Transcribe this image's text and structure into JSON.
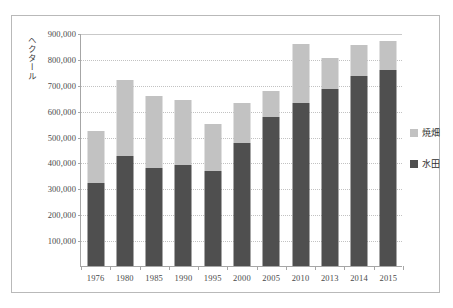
{
  "chart_data": {
    "type": "bar",
    "stacked": true,
    "title": "",
    "xlabel": "",
    "ylabel": "ヘクタール",
    "ylim": [
      0,
      900000
    ],
    "ytick_step": 100000,
    "ytick_labels": [
      "900,000",
      "800,000",
      "700,000",
      "600,000",
      "500,000",
      "400,000",
      "300,000",
      "200,000",
      "100,000"
    ],
    "ytick_values": [
      900000,
      800000,
      700000,
      600000,
      500000,
      400000,
      300000,
      200000,
      100000
    ],
    "grid": true,
    "legend_position": "right",
    "categories": [
      "1976",
      "1980",
      "1985",
      "1990",
      "1995",
      "2000",
      "2005",
      "2010",
      "2013",
      "2014",
      "2015"
    ],
    "series": [
      {
        "name": "水田",
        "color": "#4f4f4f",
        "values": [
          320000,
          425000,
          380000,
          390000,
          368000,
          475000,
          575000,
          630000,
          685000,
          735000,
          757000
        ]
      },
      {
        "name": "焼畑",
        "color": "#c2c2c2",
        "values": [
          200000,
          295000,
          275000,
          250000,
          180000,
          155000,
          100000,
          228000,
          118000,
          117000,
          113000
        ]
      }
    ],
    "totals": [
      520000,
      720000,
      655000,
      640000,
      548000,
      630000,
      675000,
      858000,
      803000,
      852000,
      870000
    ]
  },
  "legend": {
    "items": [
      {
        "label": "焼畑",
        "color": "#c2c2c2"
      },
      {
        "label": "水田",
        "color": "#4f4f4f"
      }
    ]
  },
  "colors": {
    "frame": "#b9b9b9",
    "axis": "#a6a6a6",
    "grid": "#c2c2c2",
    "text": "#4a4a4a",
    "background": "#ffffff"
  }
}
